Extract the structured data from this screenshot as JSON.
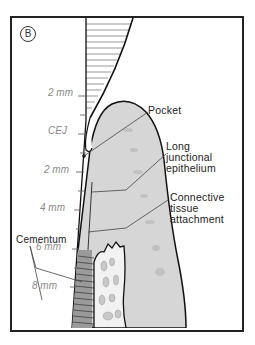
{
  "panel": {
    "badge": "B"
  },
  "scale": {
    "marks": [
      {
        "label": "2 mm",
        "y": 91
      },
      {
        "label": "CEJ",
        "y": 130
      },
      {
        "label": "2 mm",
        "y": 168
      },
      {
        "label": "4 mm",
        "y": 207
      },
      {
        "label": "6 mm",
        "y": 245
      },
      {
        "label": "8 mm",
        "y": 284
      }
    ]
  },
  "labels": {
    "pocket": "Pocket",
    "long_junctional_1": "Long",
    "long_junctional_2": "junctional",
    "long_junctional_3": "epithelium",
    "connective_1": "Connective",
    "connective_2": "tissue",
    "connective_3": "attachment",
    "cementum": "Cementum"
  },
  "colors": {
    "frame": "#222222",
    "gingiva": "#d6d6d6",
    "gingiva_dark": "#bdbdbd",
    "bone": "#f2f2f2",
    "bone_spots": "#c8c8c8",
    "scale_text": "#8a8a8a"
  }
}
